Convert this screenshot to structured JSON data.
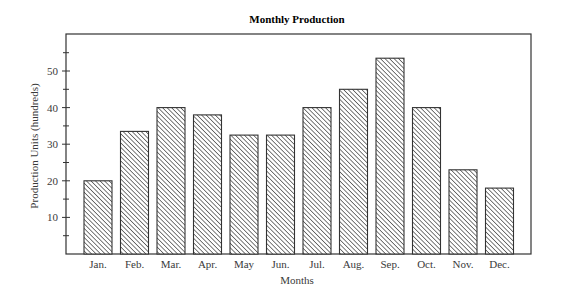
{
  "chart_data": {
    "type": "bar",
    "title": "Monthly Production",
    "xlabel": "Months",
    "ylabel": "Production Units (hundreds)",
    "categories": [
      "Jan.",
      "Feb.",
      "Mar.",
      "Apr.",
      "May",
      "Jun.",
      "Jul.",
      "Aug.",
      "Sep.",
      "Oct.",
      "Nov.",
      "Dec."
    ],
    "values": [
      20,
      33.5,
      40,
      38,
      32.5,
      32.5,
      40,
      45,
      53.5,
      40,
      23,
      18
    ],
    "ylim": [
      0,
      60
    ],
    "yticks": [
      10,
      20,
      30,
      40,
      50
    ],
    "minor_yticks": [
      5,
      15,
      25,
      35,
      45,
      55
    ],
    "grid": false,
    "legend": null,
    "bar_fill": "diagonal-hatch",
    "colors": {
      "line": "#333333",
      "hatch": "#444444",
      "background": "#ffffff"
    }
  }
}
